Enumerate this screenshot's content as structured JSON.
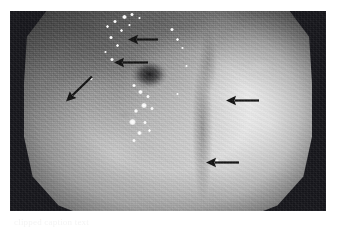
{
  "figure": {
    "kind": "endoscopy-photograph",
    "modality_label": "upper gastrointestinal endoscopy",
    "frame": {
      "border_color": "#15151a",
      "page_background": "#ffffff"
    },
    "field_of_view": {
      "shape": "octagonal",
      "base_tone": "#8f8f8f",
      "bright_tone": "#e8e8e8",
      "dark_tone": "#4b4b4b"
    },
    "caption": {
      "text": "clipped caption text"
    }
  },
  "annotations": {
    "arrow_color": "#101010",
    "arrow_count": 5,
    "arrows": [
      {
        "id": "arrow-1",
        "label": "upper lesion marker",
        "direction": "left",
        "left": 118,
        "top": 22,
        "length": 30,
        "angle": 0
      },
      {
        "id": "arrow-2",
        "label": "mid lesion marker",
        "direction": "left",
        "left": 104,
        "top": 45,
        "length": 34,
        "angle": 0
      },
      {
        "id": "arrow-3",
        "label": "left lesion marker",
        "direction": "up-right",
        "left": 56,
        "top": 84,
        "length": 36,
        "angle": -44
      },
      {
        "id": "arrow-4",
        "label": "right fold marker",
        "direction": "left",
        "left": 216,
        "top": 83,
        "length": 33,
        "angle": 0
      },
      {
        "id": "arrow-5",
        "label": "lower fold marker",
        "direction": "left",
        "left": 196,
        "top": 145,
        "length": 33,
        "angle": 0
      }
    ]
  },
  "features": {
    "dark_pit": {
      "label": "central dark depression",
      "x_pct": 43.5,
      "y_pct": 34
    },
    "specular_highlights": [
      {
        "left": 112,
        "top": 4,
        "w": 5,
        "h": 4
      },
      {
        "left": 120,
        "top": 2,
        "w": 4,
        "h": 3
      },
      {
        "left": 103,
        "top": 9,
        "w": 4,
        "h": 3
      },
      {
        "left": 96,
        "top": 14,
        "w": 3,
        "h": 3
      },
      {
        "left": 110,
        "top": 18,
        "w": 3,
        "h": 3
      },
      {
        "left": 118,
        "top": 13,
        "w": 3,
        "h": 2
      },
      {
        "left": 128,
        "top": 6,
        "w": 3,
        "h": 2
      },
      {
        "left": 99,
        "top": 25,
        "w": 4,
        "h": 3
      },
      {
        "left": 106,
        "top": 33,
        "w": 3,
        "h": 3
      },
      {
        "left": 94,
        "top": 40,
        "w": 3,
        "h": 2
      },
      {
        "left": 100,
        "top": 47,
        "w": 4,
        "h": 3
      },
      {
        "left": 122,
        "top": 73,
        "w": 4,
        "h": 3
      },
      {
        "left": 128,
        "top": 79,
        "w": 5,
        "h": 4
      },
      {
        "left": 136,
        "top": 84,
        "w": 4,
        "h": 3
      },
      {
        "left": 131,
        "top": 92,
        "w": 6,
        "h": 5
      },
      {
        "left": 124,
        "top": 98,
        "w": 4,
        "h": 4
      },
      {
        "left": 140,
        "top": 96,
        "w": 4,
        "h": 3
      },
      {
        "left": 119,
        "top": 108,
        "w": 7,
        "h": 6
      },
      {
        "left": 133,
        "top": 110,
        "w": 4,
        "h": 3
      },
      {
        "left": 127,
        "top": 120,
        "w": 5,
        "h": 4
      },
      {
        "left": 138,
        "top": 118,
        "w": 3,
        "h": 3
      },
      {
        "left": 122,
        "top": 128,
        "w": 4,
        "h": 3
      },
      {
        "left": 160,
        "top": 17,
        "w": 4,
        "h": 3
      },
      {
        "left": 166,
        "top": 27,
        "w": 3,
        "h": 3
      },
      {
        "left": 171,
        "top": 36,
        "w": 3,
        "h": 2
      },
      {
        "left": 175,
        "top": 54,
        "w": 3,
        "h": 2
      },
      {
        "left": 166,
        "top": 82,
        "w": 3,
        "h": 2
      },
      {
        "left": 79,
        "top": 66,
        "w": 4,
        "h": 3
      },
      {
        "left": 205,
        "top": 148,
        "w": 4,
        "h": 4
      }
    ]
  }
}
